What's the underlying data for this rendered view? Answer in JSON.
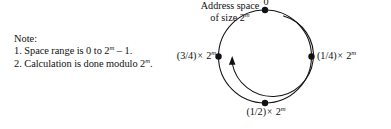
{
  "figure": {
    "name": "address-space-ring-diagram",
    "background_color": "#ffffff",
    "ink_color": "#111111"
  },
  "note": {
    "heading": "Note:",
    "items": [
      {
        "number": "1.",
        "text_before": "Space range is 0 to 2",
        "exponent": "m",
        "text_after": " – 1."
      },
      {
        "number": "2.",
        "text_before": "Calculation is done modulo 2",
        "exponent": "m",
        "text_after": "."
      }
    ],
    "line1_full": "1. Space range is 0 to 2m – 1.",
    "line2_full": "2. Calculation is done modulo 2m."
  },
  "ring": {
    "center_caption_line1": "Address space",
    "center_caption_line2_before": "of size 2",
    "center_caption_exponent": "m",
    "center_caption_full": "Address space of size 2m",
    "direction": "clockwise",
    "nodes": [
      {
        "id": "node-zero",
        "position": "top",
        "angle_deg": 0,
        "label_text": "0",
        "label_prefix": "",
        "label_exponent": ""
      },
      {
        "id": "node-quarter",
        "position": "right",
        "angle_deg": 90,
        "label_text": "(1/4) × 2",
        "label_prefix": "(1/4)",
        "label_operator": "×",
        "label_base": "2",
        "label_exponent": "m"
      },
      {
        "id": "node-half",
        "position": "bottom",
        "angle_deg": 180,
        "label_text": "(1/2) × 2",
        "label_prefix": "(1/2)",
        "label_operator": "×",
        "label_base": "2",
        "label_exponent": "m"
      },
      {
        "id": "node-three-quarter",
        "position": "left",
        "angle_deg": 270,
        "label_text": "(3/4) × 2",
        "label_prefix": "(3/4)",
        "label_operator": "×",
        "label_base": "2",
        "label_exponent": "m"
      }
    ]
  }
}
